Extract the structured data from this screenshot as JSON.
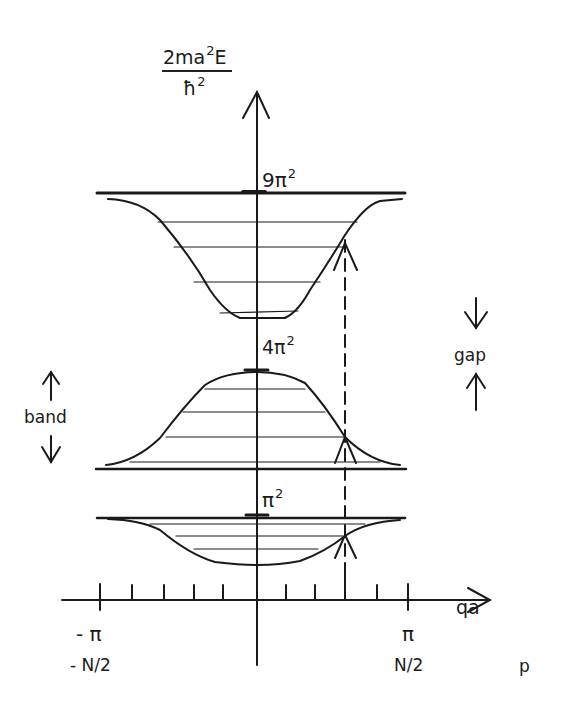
{
  "y_axis": {
    "label_numerator": "2ma",
    "label_numerator_sup": "2",
    "label_numerator_tail": "E",
    "label_denominator": "ħ",
    "label_denominator_sup": "2"
  },
  "x_axis": {
    "label": "qa",
    "secondary_label": "p",
    "ticks": {
      "left_q": "- π",
      "right_q": "π",
      "left_p": "- N/2",
      "right_p": "N/2"
    },
    "minor_tick_count_each_side": 5
  },
  "levels": [
    {
      "name": "n3",
      "label": "9π",
      "sup": "2"
    },
    {
      "name": "n2",
      "label": "4π",
      "sup": "2"
    },
    {
      "name": "n1",
      "label": "π",
      "sup": "2"
    }
  ],
  "annotations": {
    "band": "band",
    "gap": "gap"
  },
  "bands": [
    {
      "index": 1,
      "shape": "dip",
      "free_particle_edge": "π²",
      "horizontal_levels": 4
    },
    {
      "index": 2,
      "shape": "hump",
      "free_particle_edge": "4π²",
      "horizontal_levels": 4
    },
    {
      "index": 3,
      "shape": "dip",
      "free_particle_edge": "9π²",
      "horizontal_levels": 4
    }
  ],
  "colors": {
    "ink": "#1a1a1a",
    "background": "#ffffff"
  }
}
